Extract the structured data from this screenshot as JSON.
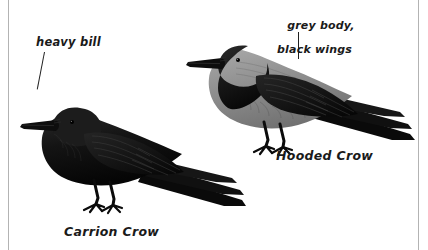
{
  "figure": {
    "type": "field-guide-illustration",
    "background_color": "#ffffff",
    "ink_color": "#111111",
    "rule_color": "#b3b3b3",
    "grey_plumage_color": "#8a8a8a"
  },
  "annotations": {
    "heavy_bill": "heavy bill",
    "grey_body_line1": "grey body,",
    "grey_body_line2": "black wings"
  },
  "captions": {
    "carrion_crow": "Carrion Crow",
    "hooded_crow": "Hooded Crow"
  },
  "birds": [
    {
      "name": "Carrion Crow",
      "plumage": "all black",
      "facing": "left"
    },
    {
      "name": "Hooded Crow",
      "plumage": "grey body, black head and wings",
      "facing": "left"
    }
  ]
}
